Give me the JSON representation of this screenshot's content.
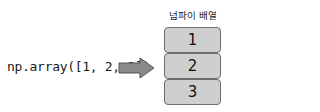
{
  "code_label": "np.array([1, 2, 3])",
  "array_title": "넘파이 배열",
  "cells": [
    "1",
    "2",
    "3"
  ],
  "colors": {
    "cell_fill": "#cfcfcf",
    "cell_border": "#6e6e6e",
    "arrow_fill": "#8a8a8a",
    "arrow_stroke": "#555555"
  }
}
